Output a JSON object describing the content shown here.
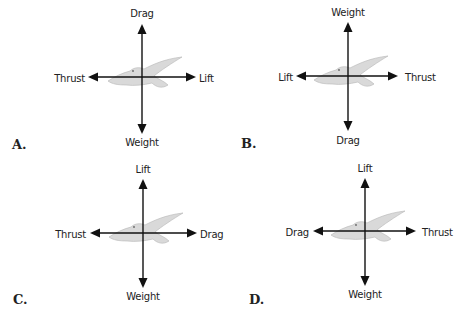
{
  "diagram": {
    "type": "force-diagram-multiple-choice",
    "colors": {
      "arrow": "#111111",
      "bird_fill": "#d9d9d9",
      "bird_stroke": "#b5b5b5",
      "text": "#222222"
    },
    "options": [
      {
        "letter": "A.",
        "up": "Drag",
        "down": "Weight",
        "left": "Thrust",
        "right": "Lift"
      },
      {
        "letter": "B.",
        "up": "Weight",
        "down": "Drag",
        "left": "Lift",
        "right": "Thrust"
      },
      {
        "letter": "C.",
        "up": "Lift",
        "down": "Weight",
        "left": "Thrust",
        "right": "Drag"
      },
      {
        "letter": "D.",
        "up": "Lift",
        "down": "Weight",
        "left": "Drag",
        "right": "Thrust"
      }
    ]
  }
}
